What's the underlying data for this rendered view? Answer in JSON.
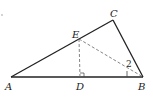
{
  "diagram": {
    "type": "triangle-geometry",
    "points": {
      "A": {
        "label": "A",
        "x": 11,
        "y": 77
      },
      "B": {
        "label": "B",
        "x": 143,
        "y": 77
      },
      "C": {
        "label": "C",
        "x": 113,
        "y": 20
      },
      "D": {
        "label": "D",
        "x": 80,
        "y": 77
      },
      "E": {
        "label": "E",
        "x": 79,
        "y": 39
      }
    },
    "segments": [
      {
        "from": "A",
        "to": "B",
        "style": "solid"
      },
      {
        "from": "B",
        "to": "C",
        "style": "solid"
      },
      {
        "from": "C",
        "to": "A",
        "style": "solid"
      },
      {
        "from": "E",
        "to": "D",
        "style": "dashed"
      },
      {
        "from": "E",
        "to": "B",
        "style": "dashed"
      }
    ],
    "angle_labels": [
      {
        "label": "2",
        "vertex": "B"
      }
    ],
    "right_angle_at": "D",
    "colors": {
      "stroke": "#222222",
      "dashed": "#666666",
      "background": "#ffffff"
    }
  }
}
